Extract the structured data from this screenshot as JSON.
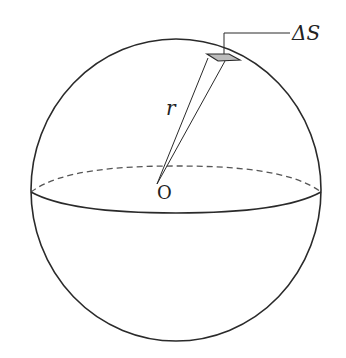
{
  "diagram": {
    "labels": {
      "area_element": "ΔS",
      "radius": "r",
      "center": "O"
    },
    "colors": {
      "stroke": "#2a2a2a",
      "dashed": "#555555",
      "patch_fill": "#bdbdbd"
    }
  }
}
